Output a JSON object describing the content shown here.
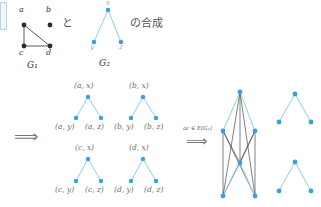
{
  "figure": {
    "caption_parts": {
      "conjunction": "と",
      "composition": "の合成"
    },
    "arrow_glyph": "⟹",
    "condition_label": "ac ∈ E(G₁)"
  },
  "graph_g1": {
    "name": "G₁",
    "vertices": [
      {
        "id": "a",
        "label": "a",
        "x": 24,
        "y": 25,
        "label_x": 19,
        "label_y": 8
      },
      {
        "id": "b",
        "label": "b",
        "x": 50,
        "y": 25,
        "label_x": 45,
        "label_y": 8
      },
      {
        "id": "c",
        "label": "c",
        "x": 24,
        "y": 46,
        "label_x": 19,
        "label_y": 50
      },
      {
        "id": "d",
        "label": "d",
        "x": 50,
        "y": 46,
        "label_x": 45,
        "label_y": 50
      }
    ],
    "edges": [
      [
        "a",
        "c"
      ],
      [
        "a",
        "d"
      ],
      [
        "c",
        "d"
      ]
    ],
    "name_x": 28,
    "name_y": 61
  },
  "graph_g2": {
    "name": "G₂",
    "vertices": [
      {
        "id": "x",
        "label": "x",
        "x": 108,
        "y": 10,
        "label_x": 105,
        "label_y": 1
      },
      {
        "id": "y",
        "label": "y",
        "x": 94,
        "y": 42,
        "label_x": 90,
        "label_y": 45
      },
      {
        "id": "z",
        "label": "z",
        "x": 121,
        "y": 42,
        "label_x": 118,
        "label_y": 45
      }
    ],
    "edges": [
      [
        "x",
        "y"
      ],
      [
        "x",
        "z"
      ]
    ],
    "name_x": 100,
    "name_y": 59
  },
  "copies": {
    "blocks": [
      {
        "id": "copy-a",
        "top": {
          "label": "(a, x)",
          "x": 88,
          "y": 97,
          "label_x": 73,
          "label_y": 84
        },
        "left": {
          "label": "(a, y)",
          "x": 76,
          "y": 118,
          "label_x": 55,
          "label_y": 124
        },
        "right": {
          "label": "(a, z)",
          "x": 101,
          "y": 118,
          "label_x": 86,
          "label_y": 124
        }
      },
      {
        "id": "copy-b",
        "top": {
          "label": "(b, x)",
          "x": 143,
          "y": 97,
          "label_x": 128,
          "label_y": 84
        },
        "left": {
          "label": "(b, y)",
          "x": 131,
          "y": 118,
          "label_x": 116,
          "label_y": 124
        },
        "right": {
          "label": "(b, z)",
          "x": 156,
          "y": 118,
          "label_x": 144,
          "label_y": 124
        }
      },
      {
        "id": "copy-c",
        "top": {
          "label": "(c, x)",
          "x": 88,
          "y": 159,
          "label_x": 74,
          "label_y": 145
        },
        "left": {
          "label": "(c, y)",
          "x": 76,
          "y": 181,
          "label_x": 55,
          "label_y": 187
        },
        "right": {
          "label": "(c, z)",
          "x": 101,
          "y": 181,
          "label_x": 86,
          "label_y": 187
        }
      },
      {
        "id": "copy-d",
        "top": {
          "label": "(d, x)",
          "x": 143,
          "y": 159,
          "label_x": 128,
          "label_y": 145
        },
        "left": {
          "label": "(d, y)",
          "x": 131,
          "y": 181,
          "label_x": 116,
          "label_y": 187
        },
        "right": {
          "label": "(d, z)",
          "x": 156,
          "y": 181,
          "label_x": 144,
          "label_y": 187
        }
      }
    ]
  },
  "result_graph": {
    "joined_cluster": {
      "upper": {
        "top": {
          "x": 240,
          "y": 92
        },
        "left": {
          "x": 223,
          "y": 131
        },
        "right": {
          "x": 255,
          "y": 131
        }
      },
      "lower": {
        "top": {
          "x": 240,
          "y": 163
        },
        "left": {
          "x": 223,
          "y": 196
        },
        "right": {
          "x": 255,
          "y": 196
        }
      }
    },
    "isolated_copies": [
      {
        "id": "result-copy-b",
        "top": {
          "x": 295,
          "y": 94
        },
        "left": {
          "x": 279,
          "y": 122
        },
        "right": {
          "x": 311,
          "y": 122
        }
      },
      {
        "id": "result-copy-d",
        "top": {
          "x": 295,
          "y": 162
        },
        "left": {
          "x": 279,
          "y": 191
        },
        "right": {
          "x": 311,
          "y": 191
        }
      }
    ]
  },
  "colors": {
    "node_blue": "#3aa0dd",
    "edge_blue": "#8fcdea",
    "edge_dark": "#4a4a4a",
    "node_dark": "#2b2b2b",
    "text_gray": "#6b6b6b"
  }
}
